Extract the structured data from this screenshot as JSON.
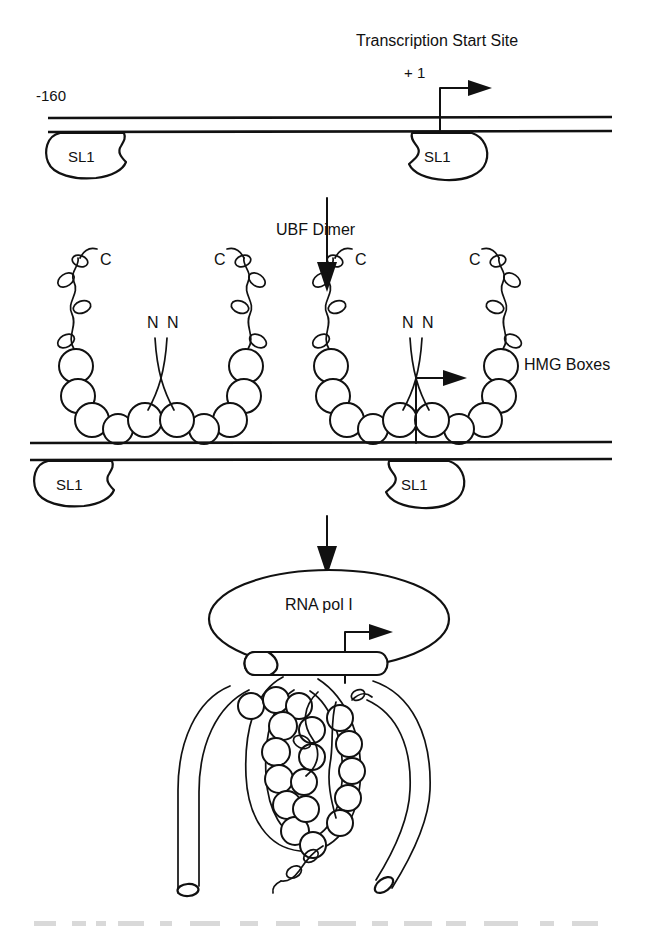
{
  "figure": {
    "background_color": "#ffffff",
    "ink_color": "#111111"
  },
  "panel_top": {
    "name": "SL1 bound promoter",
    "transcription_start_label": "Transcription Start Site",
    "plus_one_label": "+ 1",
    "upstream_label": "-160",
    "sl1_left_label": "SL1",
    "sl1_right_label": "SL1"
  },
  "panel_middle": {
    "name": "UBF dimer bound promoter",
    "ubf_dimer_label": "UBF Dimer",
    "hmg_boxes_label": "HMG Boxes",
    "c_terminus_labels": [
      "C",
      "C",
      "C",
      "C"
    ],
    "n_terminus_labels": [
      "N",
      "N",
      "N",
      "N"
    ],
    "sl1_left_label": "SL1",
    "sl1_right_label": "SL1",
    "dimers": [
      {
        "id": "dimer-left",
        "hmg_box_count_per_arm": 6
      },
      {
        "id": "dimer-right",
        "hmg_box_count_per_arm": 6
      }
    ]
  },
  "panel_bottom": {
    "name": "RNA polymerase I holoenzyme complex",
    "rna_pol_label": "RNA pol I",
    "sl1_lozenge_count": 2,
    "dna_strand_ends": 2
  },
  "arrows": {
    "step_1_to_2": "downward-arrow",
    "step_2_to_3": "downward-arrow",
    "transcription_direction": "rightward-arrow"
  },
  "caption": {
    "text": "partially visible caption text at page bottom edge"
  }
}
